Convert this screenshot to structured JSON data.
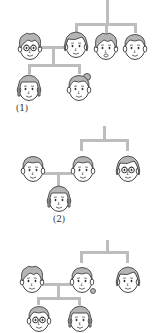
{
  "figure": {
    "type": "family-tree-diagrams",
    "connector_color": "#bdbdbd",
    "outline_color": "#444444",
    "hair_color": "#b5b5b5"
  },
  "trees": [
    {
      "label": "(1)",
      "members": [
        {
          "role": "father",
          "traits": "short hair, glasses"
        },
        {
          "role": "mother",
          "traits": "bob hair"
        },
        {
          "role": "mother-sibling-1",
          "traits": "boy, open mouth"
        },
        {
          "role": "mother-sibling-2",
          "traits": "boy"
        },
        {
          "role": "child-1",
          "traits": "girl, straight hair"
        },
        {
          "role": "child-2",
          "traits": "girl, hair bun"
        }
      ]
    },
    {
      "label": "(2)",
      "members": [
        {
          "role": "father",
          "traits": "short hair"
        },
        {
          "role": "mother",
          "traits": "short hair"
        },
        {
          "role": "mother-sibling",
          "traits": "curly hair, glasses"
        },
        {
          "role": "child",
          "traits": "girl"
        }
      ]
    },
    {
      "label": "",
      "members": [
        {
          "role": "father",
          "traits": "short hair"
        },
        {
          "role": "mother",
          "traits": "ponytail"
        },
        {
          "role": "mother-sibling",
          "traits": "woman, side-swept hair"
        },
        {
          "role": "child-1",
          "traits": "girl, glasses"
        },
        {
          "role": "child-2",
          "traits": "girl"
        }
      ]
    }
  ]
}
